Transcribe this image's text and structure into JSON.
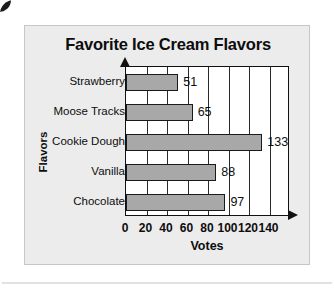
{
  "chart_data": {
    "type": "bar",
    "orientation": "horizontal",
    "title": "Favorite Ice Cream Flavors",
    "xlabel": "Votes",
    "ylabel": "Flavors",
    "categories": [
      "Strawberry",
      "Moose Tracks",
      "Cookie Dough",
      "Vanilla",
      "Chocolate"
    ],
    "values": [
      51,
      65,
      133,
      88,
      97
    ],
    "value_labels": [
      "51",
      "65",
      "133",
      "88",
      "97"
    ],
    "xticks": [
      0,
      20,
      40,
      60,
      80,
      100,
      120,
      140
    ],
    "xtick_labels": [
      "0",
      "20",
      "40",
      "60",
      "80",
      "100",
      "120",
      "140"
    ],
    "xlim": [
      0,
      160
    ],
    "grid": "vertical",
    "legend": "none",
    "bar_color": "#a8a8a8",
    "bar_edge_color": "#1a1a1a",
    "plot_background": "#ffffff",
    "card_background": "#ececec",
    "text_color": "#0d0d0d"
  },
  "icons": {
    "corner_mark": "filled-circle-icon",
    "y_axis_arrow": "arrow-up-icon",
    "x_axis_arrow": "arrow-right-icon"
  }
}
